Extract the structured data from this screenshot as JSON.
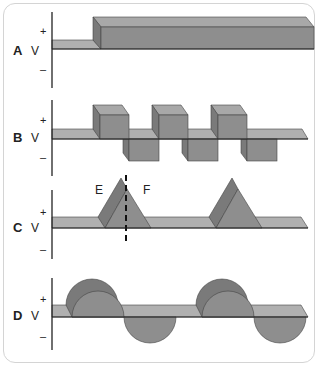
{
  "figure": {
    "colors": {
      "front": "#8e8e8e",
      "top": "#a8a8a8",
      "side": "#7a7a7a",
      "band": "#b0b0b0",
      "line": "#222222",
      "border": "#d4d4d4"
    },
    "panels": [
      {
        "id": "A",
        "letter": "A",
        "axis_label": "V",
        "plus": "+",
        "minus": "–",
        "waveform": "step"
      },
      {
        "id": "B",
        "letter": "B",
        "axis_label": "V",
        "plus": "+",
        "minus": "–",
        "waveform": "square"
      },
      {
        "id": "C",
        "letter": "C",
        "axis_label": "V",
        "plus": "+",
        "minus": "–",
        "waveform": "triangle-pulses",
        "annotations": {
          "left": "E",
          "right": "F"
        }
      },
      {
        "id": "D",
        "letter": "D",
        "axis_label": "V",
        "plus": "+",
        "minus": "–",
        "waveform": "sine"
      }
    ]
  }
}
